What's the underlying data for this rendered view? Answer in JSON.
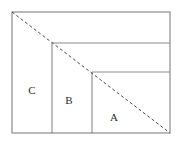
{
  "figure": {
    "type": "geometric-diagram",
    "background_color": "#ffffff",
    "outer_rectangle": {
      "name": "outer-rectangle",
      "x": 12,
      "y": 12,
      "width": 158,
      "height": 121,
      "stroke_color": "#8a8a8a",
      "stroke_width": 1.2,
      "fill": "none"
    },
    "diagonal": {
      "name": "diagonal-dashed-line",
      "x1": 12,
      "y1": 12,
      "x2": 170,
      "y2": 133,
      "stroke_color": "#4a4a4a",
      "stroke_width": 1,
      "dash_pattern": "3 2.5"
    },
    "step_lines": [
      {
        "name": "horizontal-divider-upper",
        "orientation": "horizontal",
        "x1": 52,
        "y1": 43,
        "x2": 170,
        "y2": 43,
        "stroke_color": "#8a8a8a",
        "stroke_width": 1.1
      },
      {
        "name": "vertical-divider-left",
        "orientation": "vertical",
        "x1": 52,
        "y1": 43,
        "x2": 52,
        "y2": 133,
        "stroke_color": "#8a8a8a",
        "stroke_width": 1.1
      },
      {
        "name": "horizontal-divider-lower",
        "orientation": "horizontal",
        "x1": 92,
        "y1": 72,
        "x2": 170,
        "y2": 72,
        "stroke_color": "#8a8a8a",
        "stroke_width": 1.1
      },
      {
        "name": "vertical-divider-right",
        "orientation": "vertical",
        "x1": 92,
        "y1": 72,
        "x2": 92,
        "y2": 133,
        "stroke_color": "#8a8a8a",
        "stroke_width": 1.1
      }
    ],
    "labels": [
      {
        "name": "region-label-c",
        "text": "C",
        "x": 32,
        "y": 91
      },
      {
        "name": "region-label-b",
        "text": "B",
        "x": 69,
        "y": 101
      },
      {
        "name": "region-label-a",
        "text": "A",
        "x": 114,
        "y": 118
      }
    ]
  }
}
